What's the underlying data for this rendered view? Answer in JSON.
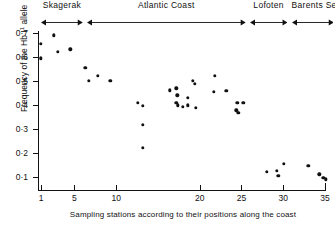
{
  "chart_data": {
    "type": "scatter",
    "title": "",
    "xlabel": "Sampling stations according to their positions along the coast",
    "ylabel": "Frequency of the HbI¹ allele",
    "ylabel_base": "Frequency of the Hb I",
    "ylabel_sup": "1",
    "ylabel_tail": " allele",
    "xlim": [
      0,
      36
    ],
    "ylim": [
      0,
      0.75
    ],
    "grid": false,
    "legend": "none",
    "xticks": [
      1,
      5,
      10,
      20,
      25,
      30,
      35
    ],
    "xticklabels": [
      "1",
      "5",
      "10",
      "20",
      "25",
      "30",
      "35"
    ],
    "yticks": [
      0.1,
      0.2,
      0.3,
      0.4,
      0.5,
      0.6,
      0.7
    ],
    "yticklabels": [
      "0·1",
      "0·2",
      "0·3",
      "0·4",
      "0·5",
      "0·6",
      "0·7"
    ],
    "regions": [
      {
        "name": "Skagerak",
        "label": "Skagerak",
        "x_start": 1,
        "x_end": 6
      },
      {
        "name": "Atlantic Coast",
        "label": "Atlantic Coast",
        "x_start": 6.5,
        "x_end": 25.5
      },
      {
        "name": "Lofoten",
        "label": "Lofoten",
        "x_start": 26,
        "x_end": 30.5
      },
      {
        "name": "Barents Sea",
        "label": "Barents Sea",
        "x_start": 31,
        "x_end": 36
      }
    ],
    "points": [
      {
        "x": 1.0,
        "y": 0.655
      },
      {
        "x": 1.0,
        "y": 0.595
      },
      {
        "x": 2.5,
        "y": 0.69
      },
      {
        "x": 3.0,
        "y": 0.622
      },
      {
        "x": 4.5,
        "y": 0.632
      },
      {
        "x": 6.3,
        "y": 0.555
      },
      {
        "x": 6.7,
        "y": 0.5
      },
      {
        "x": 7.8,
        "y": 0.522
      },
      {
        "x": 9.3,
        "y": 0.5
      },
      {
        "x": 12.6,
        "y": 0.408
      },
      {
        "x": 13.2,
        "y": 0.396
      },
      {
        "x": 13.2,
        "y": 0.318
      },
      {
        "x": 13.2,
        "y": 0.222
      },
      {
        "x": 16.4,
        "y": 0.462
      },
      {
        "x": 17.2,
        "y": 0.47
      },
      {
        "x": 17.3,
        "y": 0.44
      },
      {
        "x": 17.2,
        "y": 0.408
      },
      {
        "x": 17.4,
        "y": 0.398
      },
      {
        "x": 18.0,
        "y": 0.392
      },
      {
        "x": 18.6,
        "y": 0.43
      },
      {
        "x": 18.6,
        "y": 0.398
      },
      {
        "x": 19.2,
        "y": 0.5
      },
      {
        "x": 19.4,
        "y": 0.488
      },
      {
        "x": 19.5,
        "y": 0.388
      },
      {
        "x": 21.8,
        "y": 0.522
      },
      {
        "x": 21.7,
        "y": 0.456
      },
      {
        "x": 23.2,
        "y": 0.46
      },
      {
        "x": 24.5,
        "y": 0.408
      },
      {
        "x": 25.2,
        "y": 0.41
      },
      {
        "x": 24.4,
        "y": 0.378
      },
      {
        "x": 24.6,
        "y": 0.368
      },
      {
        "x": 28.0,
        "y": 0.122
      },
      {
        "x": 29.2,
        "y": 0.127
      },
      {
        "x": 29.4,
        "y": 0.106
      },
      {
        "x": 30.1,
        "y": 0.155
      },
      {
        "x": 33.0,
        "y": 0.146
      },
      {
        "x": 34.3,
        "y": 0.112
      },
      {
        "x": 34.8,
        "y": 0.096
      },
      {
        "x": 35.1,
        "y": 0.09
      }
    ]
  }
}
